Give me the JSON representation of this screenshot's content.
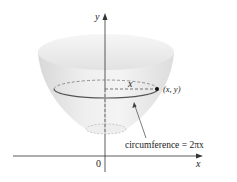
{
  "diagram": {
    "axes": {
      "y_label": "y",
      "x_label": "x",
      "origin_label": "0"
    },
    "radius_label": "x",
    "point_label": "(x, y)",
    "annotation": "circumference = 2πx",
    "colors": {
      "surface": "#e6e6e6",
      "surface_dark": "#d4d4d4",
      "axis": "#333333",
      "circle": "#555555"
    }
  }
}
